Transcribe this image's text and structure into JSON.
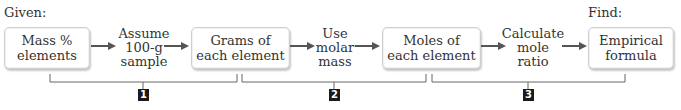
{
  "given_label": "Given:",
  "find_label": "Find:",
  "boxes": [
    {
      "line1": "Mass %",
      "line2": "elements"
    },
    {
      "line1": "Grams of",
      "line2": "each element"
    },
    {
      "line1": "Moles of",
      "line2": "each element"
    },
    {
      "line1": "Empirical",
      "line2": "formula"
    }
  ],
  "steps": [
    {
      "line1": "Assume",
      "line2": "100-g",
      "line3": "sample"
    },
    {
      "line1": "Use",
      "line2": "molar",
      "line3": "mass"
    },
    {
      "line1": "Calculate",
      "line2": "mole ratio"
    }
  ],
  "brackets": [
    {
      "number": "1"
    },
    {
      "number": "2"
    },
    {
      "number": "3"
    }
  ],
  "colors": {
    "arrow": "#555555",
    "bracket": "#666666",
    "number_badge": "#1a1a1a",
    "box_border": "#cfcfcf"
  }
}
